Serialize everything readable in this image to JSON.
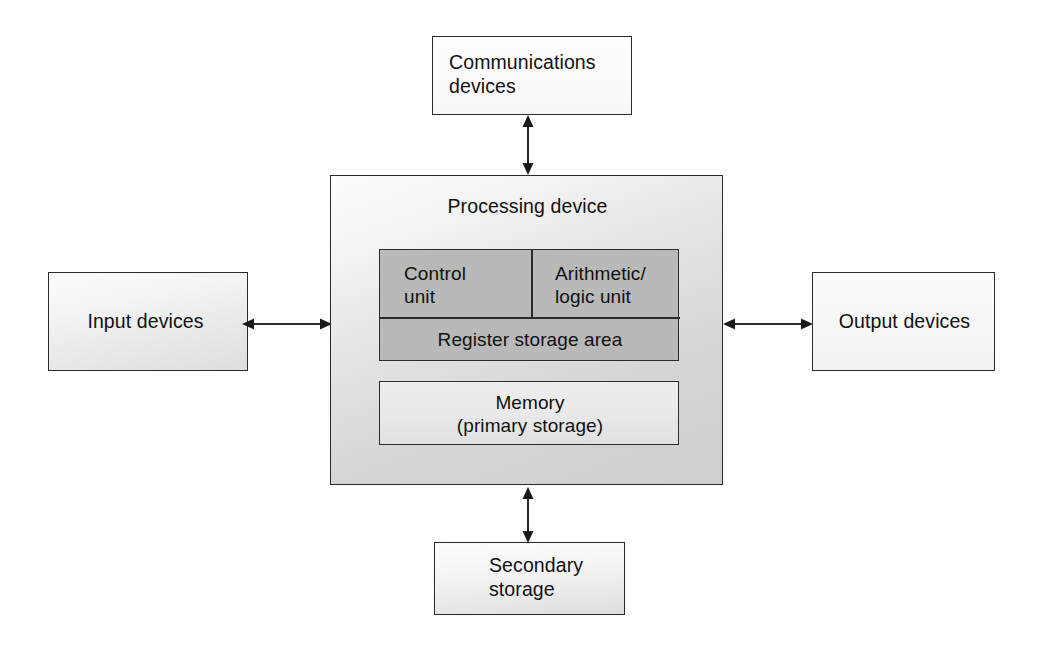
{
  "diagram": {
    "nodes": {
      "communications": {
        "label": "Communications\ndevices",
        "name": "communications-devices-box"
      },
      "input": {
        "label": "Input devices",
        "name": "input-devices-box"
      },
      "output": {
        "label": "Output devices",
        "name": "output-devices-box"
      },
      "secondary": {
        "label": "Secondary\nstorage",
        "name": "secondary-storage-box"
      },
      "processing": {
        "label": "Processing device",
        "name": "processing-device-box"
      },
      "control_unit": {
        "label": "Control\nunit",
        "name": "control-unit-cell"
      },
      "alu": {
        "label": "Arithmetic/\nlogic unit",
        "name": "arithmetic-logic-unit-cell"
      },
      "register": {
        "label": "Register storage area",
        "name": "register-storage-area-cell"
      },
      "memory": {
        "label": "Memory\n(primary storage)",
        "name": "memory-box"
      }
    },
    "connectors": {
      "comms_to_processing": "double-headed-vertical-arrow",
      "input_to_processing": "double-headed-horizontal-arrow",
      "processing_to_output": "double-headed-horizontal-arrow",
      "processing_to_secondary": "double-headed-vertical-arrow"
    },
    "colors": {
      "stroke": "#2b2b2b",
      "text": "#111111",
      "cpu_fill": "#b9b9b9",
      "processing_fill": "#d5d5d5",
      "memory_fill": "#e8e8e8",
      "page_bg": "#fefefe"
    }
  }
}
